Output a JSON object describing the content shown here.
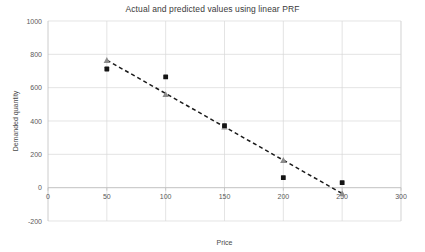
{
  "chart_data": {
    "type": "scatter",
    "title": "Actual and predicted values using linear PRF",
    "xlabel": "Price",
    "ylabel": "Demanded quantity",
    "xlim": [
      0,
      300
    ],
    "ylim": [
      -200,
      1000
    ],
    "xticks": [
      0,
      50,
      100,
      150,
      200,
      250,
      300
    ],
    "yticks": [
      -200,
      0,
      200,
      400,
      600,
      800,
      1000
    ],
    "xtick_labels": [
      "0",
      "50",
      "100",
      "150",
      "200",
      "250",
      "300"
    ],
    "ytick_labels": [
      "-200",
      "0",
      "200",
      "400",
      "600",
      "800",
      "1000"
    ],
    "grid": true,
    "legend": "none",
    "x": [
      50,
      100,
      150,
      200,
      250
    ],
    "series": [
      {
        "name": "Actual",
        "marker": "square",
        "color": "#141414",
        "values": [
          712,
          665,
          372,
          60,
          30
        ]
      },
      {
        "name": "Predicted",
        "marker": "triangle",
        "color": "#8c8c8c",
        "values": [
          765,
          560,
          365,
          165,
          -35
        ]
      }
    ],
    "trendline": {
      "name": "linear PRF",
      "style": "dashed",
      "color": "#1a1a1a",
      "x": [
        50,
        250
      ],
      "y": [
        765,
        -35
      ]
    }
  },
  "axes": {
    "x_axis_name": "price-axis",
    "y_axis_name": "demanded-quantity-axis"
  }
}
